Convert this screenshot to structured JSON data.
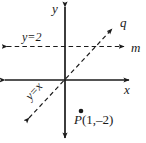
{
  "figure": {
    "type": "coordinate-plane-diagram",
    "background_color": "#ffffff",
    "line_color": "#1a1a1a",
    "width": 146,
    "height": 143
  },
  "axes": {
    "x_label": "x",
    "y_label": "y",
    "origin": {
      "x": 65,
      "y": 80
    },
    "x_axis": {
      "x1": 4,
      "y1": 80,
      "x2": 130,
      "y2": 80,
      "style": "solid",
      "arrows": "both"
    },
    "y_axis": {
      "x1": 65,
      "y1": 6,
      "x2": 65,
      "y2": 139,
      "style": "solid",
      "arrows": "both"
    }
  },
  "lines": [
    {
      "name": "m",
      "label": "m",
      "equation_label": "y=2",
      "style": "dashed",
      "arrows": "both",
      "x1": 5,
      "y1": 46,
      "x2": 126,
      "y2": 46
    },
    {
      "name": "q",
      "label": "q",
      "equation_label": "y=x",
      "style": "dashed",
      "arrows": "both",
      "x1": 27,
      "y1": 120,
      "x2": 114,
      "y2": 27
    }
  ],
  "points": [
    {
      "name": "P",
      "label_name": "P",
      "label_coords": "(1,–2)",
      "x": 81,
      "y": 111,
      "marker": "filled-dot"
    }
  ]
}
